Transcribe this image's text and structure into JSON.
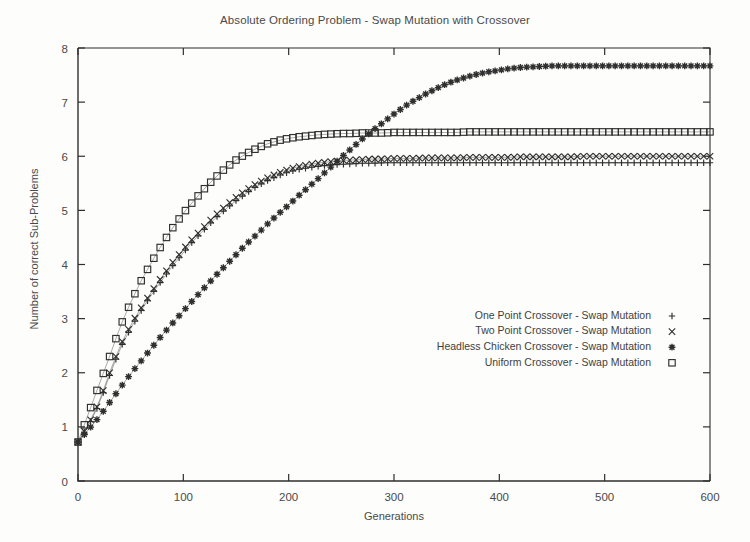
{
  "chart_data": {
    "type": "line",
    "title": "Absolute Ordering Problem - Swap Mutation with Crossover",
    "xlabel": "Generations",
    "ylabel": "Number of correct Sub-Problems",
    "xlim": [
      0,
      600
    ],
    "ylim": [
      0,
      8
    ],
    "xticks": [
      0,
      100,
      200,
      300,
      400,
      500,
      600
    ],
    "yticks": [
      0,
      1,
      2,
      3,
      4,
      5,
      6,
      7,
      8
    ],
    "grid": false,
    "legend_position": "center-right-inside",
    "x": [
      0,
      10,
      20,
      30,
      40,
      50,
      60,
      70,
      80,
      90,
      100,
      110,
      120,
      130,
      140,
      150,
      160,
      170,
      180,
      190,
      200,
      210,
      220,
      230,
      240,
      250,
      260,
      270,
      280,
      290,
      300,
      310,
      320,
      330,
      340,
      350,
      360,
      370,
      380,
      390,
      400,
      410,
      420,
      430,
      440,
      450,
      460,
      470,
      480,
      490,
      500,
      510,
      520,
      530,
      540,
      550,
      560,
      570,
      580,
      590,
      600
    ],
    "series": [
      {
        "name": "One Point Crossover - Swap Mutation",
        "marker": "+",
        "marker_glyph": "+",
        "plateau": 5.88,
        "values": [
          0.72,
          1.02,
          1.42,
          1.95,
          2.45,
          2.82,
          3.15,
          3.45,
          3.72,
          3.98,
          4.22,
          4.45,
          4.65,
          4.85,
          5.02,
          5.18,
          5.32,
          5.45,
          5.55,
          5.64,
          5.71,
          5.76,
          5.79,
          5.82,
          5.84,
          5.85,
          5.86,
          5.87,
          5.87,
          5.88,
          5.88,
          5.88,
          5.88,
          5.88,
          5.88,
          5.88,
          5.88,
          5.88,
          5.88,
          5.88,
          5.88,
          5.88,
          5.88,
          5.88,
          5.88,
          5.88,
          5.88,
          5.88,
          5.88,
          5.88,
          5.88,
          5.88,
          5.88,
          5.88,
          5.88,
          5.88,
          5.88,
          5.88,
          5.88,
          5.88,
          5.88
        ]
      },
      {
        "name": "Two Point Crossover - Swap Mutation",
        "marker": "x",
        "marker_glyph": "×",
        "plateau": 6.0,
        "values": [
          0.72,
          1.05,
          1.45,
          2.0,
          2.5,
          2.88,
          3.2,
          3.5,
          3.78,
          4.04,
          4.28,
          4.5,
          4.7,
          4.9,
          5.08,
          5.24,
          5.38,
          5.5,
          5.6,
          5.69,
          5.76,
          5.81,
          5.85,
          5.88,
          5.9,
          5.92,
          5.93,
          5.94,
          5.95,
          5.95,
          5.96,
          5.96,
          5.96,
          5.97,
          5.97,
          5.97,
          5.97,
          5.98,
          5.98,
          5.98,
          5.98,
          5.98,
          5.99,
          5.99,
          5.99,
          5.99,
          5.99,
          5.99,
          6.0,
          6.0,
          6.0,
          6.0,
          6.0,
          6.0,
          6.0,
          6.0,
          6.0,
          6.0,
          6.0,
          6.0,
          6.0
        ]
      },
      {
        "name": "Headless Chicken Crossover - Swap Mutation",
        "marker": "star",
        "marker_glyph": "✳",
        "plateau": 7.67,
        "values": [
          0.72,
          0.95,
          1.18,
          1.45,
          1.72,
          1.98,
          2.22,
          2.46,
          2.7,
          2.92,
          3.14,
          3.36,
          3.57,
          3.78,
          3.98,
          4.18,
          4.38,
          4.56,
          4.75,
          4.93,
          5.1,
          5.28,
          5.45,
          5.62,
          5.8,
          5.98,
          6.15,
          6.32,
          6.48,
          6.63,
          6.78,
          6.92,
          7.04,
          7.15,
          7.25,
          7.34,
          7.41,
          7.47,
          7.52,
          7.56,
          7.59,
          7.62,
          7.64,
          7.65,
          7.66,
          7.67,
          7.67,
          7.67,
          7.67,
          7.67,
          7.67,
          7.67,
          7.67,
          7.67,
          7.67,
          7.67,
          7.67,
          7.67,
          7.67,
          7.67,
          7.67
        ]
      },
      {
        "name": "Uniform Crossover - Swap Mutation",
        "marker": "square",
        "marker_glyph": "□",
        "plateau": 6.45,
        "values": [
          0.72,
          1.25,
          1.78,
          2.3,
          2.85,
          3.3,
          3.7,
          4.05,
          4.38,
          4.68,
          4.95,
          5.18,
          5.4,
          5.6,
          5.78,
          5.93,
          6.05,
          6.15,
          6.23,
          6.29,
          6.33,
          6.36,
          6.38,
          6.4,
          6.41,
          6.42,
          6.42,
          6.43,
          6.43,
          6.43,
          6.44,
          6.44,
          6.44,
          6.44,
          6.44,
          6.44,
          6.44,
          6.45,
          6.45,
          6.45,
          6.45,
          6.45,
          6.45,
          6.45,
          6.45,
          6.45,
          6.45,
          6.45,
          6.45,
          6.45,
          6.45,
          6.45,
          6.45,
          6.45,
          6.45,
          6.45,
          6.45,
          6.45,
          6.45,
          6.45,
          6.45
        ]
      }
    ]
  }
}
